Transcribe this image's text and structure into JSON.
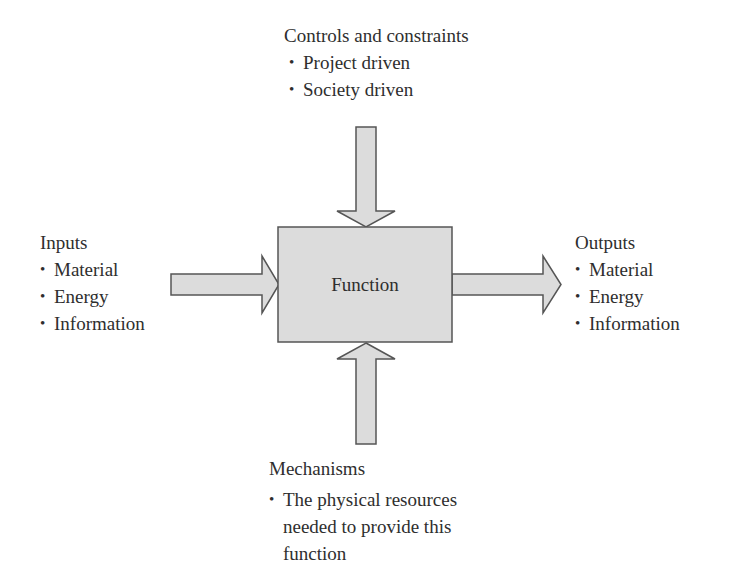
{
  "diagram": {
    "type": "IDEF0 function block",
    "colors": {
      "fill": "#dcdcdc",
      "stroke": "#555555",
      "text": "#2e2e2e",
      "background": "#ffffff"
    },
    "function": {
      "label": "Function"
    },
    "controls": {
      "heading": "Controls and constraints",
      "items": [
        "Project driven",
        "Society driven"
      ]
    },
    "inputs": {
      "heading": "Inputs",
      "items": [
        "Material",
        "Energy",
        "Information"
      ]
    },
    "outputs": {
      "heading": "Outputs",
      "items": [
        "Material",
        "Energy",
        "Information"
      ]
    },
    "mechanisms": {
      "heading": "Mechanisms",
      "items": [
        "The physical resources needed to provide this function"
      ]
    },
    "edges": [
      {
        "from": "controls",
        "to": "function",
        "direction": "down"
      },
      {
        "from": "inputs",
        "to": "function",
        "direction": "right"
      },
      {
        "from": "function",
        "to": "outputs",
        "direction": "right"
      },
      {
        "from": "mechanisms",
        "to": "function",
        "direction": "up"
      }
    ]
  }
}
